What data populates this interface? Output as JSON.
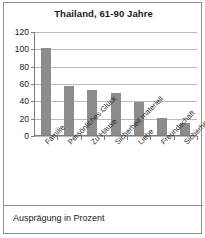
{
  "chart_data": {
    "type": "bar",
    "title": "Thailand, 61-90 Jahre",
    "categories": [
      "Familie",
      "Persönliches Glück",
      "Zu Hause",
      "Sicherheit materiell",
      "Liebe",
      "Freundschaft",
      "Sicherheit emotional"
    ],
    "values": [
      100,
      57,
      52,
      48,
      38,
      20,
      14
    ],
    "xlabel": "",
    "ylabel": "",
    "ylim": [
      0,
      120
    ],
    "yticks": [
      0,
      20,
      40,
      60,
      80,
      100,
      120
    ],
    "ytick_labels": [
      "0",
      "20",
      "40",
      "60",
      "80",
      "100",
      "120"
    ],
    "grid": true,
    "legend": false,
    "bar_color": "#8c8c8c",
    "caption": "Ausprägung in Prozent"
  },
  "colors": {
    "bar": "#8c8c8c",
    "grid": "#b9b9b9",
    "axis": "#7d7d7d",
    "frame": "#8f8f8f",
    "text": "#1a1a1a",
    "background": "#ffffff"
  }
}
